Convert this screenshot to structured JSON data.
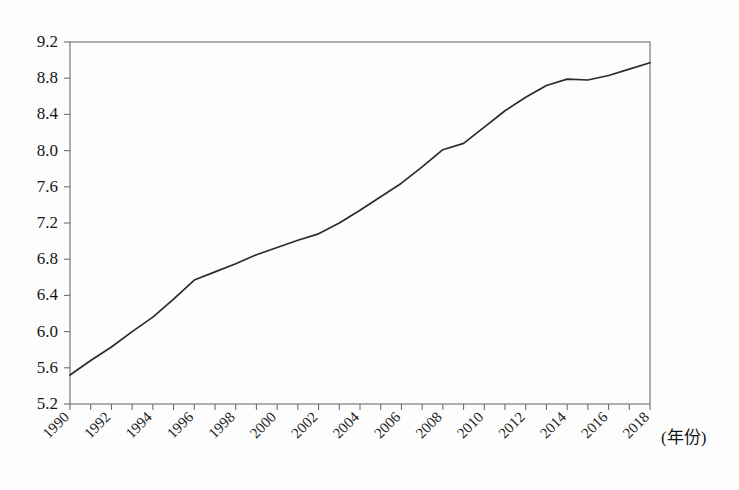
{
  "chart_data": {
    "type": "line",
    "title": "",
    "subtitle": "",
    "xlabel": "(年份)",
    "ylabel": "",
    "grid": false,
    "legend": null,
    "xlim": [
      1990,
      2018
    ],
    "ylim": [
      5.2,
      9.2
    ],
    "ytick_step": 0.4,
    "xtick_step": 1,
    "xtick_label_step": 2,
    "xtick_labels": [
      "1990",
      "1992",
      "1994",
      "1996",
      "1998",
      "2000",
      "2002",
      "2004",
      "2006",
      "2008",
      "2010",
      "2012",
      "2014",
      "2016",
      "2018"
    ],
    "ytick_labels": [
      "5.2",
      "5.6",
      "6.0",
      "6.4",
      "6.8",
      "7.2",
      "7.6",
      "8.0",
      "8.4",
      "8.8",
      "9.2"
    ],
    "x": [
      1990,
      1991,
      1992,
      1993,
      1994,
      1995,
      1996,
      1997,
      1998,
      1999,
      2000,
      2001,
      2002,
      2003,
      2004,
      2005,
      2006,
      2007,
      2008,
      2009,
      2010,
      2011,
      2012,
      2013,
      2014,
      2015,
      2016,
      2017,
      2018
    ],
    "series": [
      {
        "name": "series-1",
        "color": "#2b2b2b",
        "values": [
          5.52,
          5.68,
          5.83,
          6.0,
          6.16,
          6.36,
          6.57,
          6.66,
          6.75,
          6.85,
          6.93,
          7.01,
          7.08,
          7.2,
          7.34,
          7.49,
          7.64,
          7.82,
          8.01,
          8.08,
          8.26,
          8.44,
          8.59,
          8.72,
          8.79,
          8.78,
          8.83,
          8.9,
          8.97
        ]
      }
    ],
    "axis_caption": "(年份)"
  },
  "geometry": {
    "plot_left": 70,
    "plot_right": 650,
    "plot_top": 42,
    "plot_bottom": 404,
    "tick_length": 6,
    "xlabel_rotation": -45
  }
}
